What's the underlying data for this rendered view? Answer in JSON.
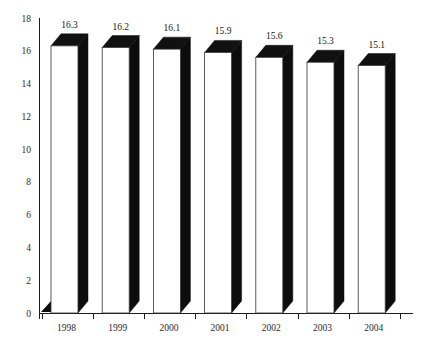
{
  "chart_data": {
    "type": "bar",
    "title": "",
    "subtitle": "",
    "xlabel": "",
    "ylabel": "",
    "categories": [
      "1998",
      "1999",
      "2000",
      "2001",
      "2002",
      "2003",
      "2004"
    ],
    "values": [
      16.3,
      16.2,
      16.1,
      15.9,
      15.6,
      15.3,
      15.1
    ],
    "value_labels": [
      "16.3",
      "16.2",
      "16.1",
      "15.9",
      "15.6",
      "15.3",
      "15.1"
    ],
    "ylim": [
      0,
      18
    ],
    "ytick_labels": [
      "0",
      "2",
      "4",
      "6",
      "8",
      "10",
      "12",
      "14",
      "16",
      "18"
    ],
    "ytick_values": [
      0,
      2,
      4,
      6,
      8,
      10,
      12,
      14,
      16,
      18
    ],
    "grid": false,
    "legend": null,
    "style": "3d-column",
    "colors": {
      "bar_front": "#ffffff",
      "bar_side": "#0d0d0d",
      "bar_top": "#111111",
      "axis": "#1a1a1a",
      "background": "#ffffff",
      "text": "#2a2a2a"
    }
  }
}
